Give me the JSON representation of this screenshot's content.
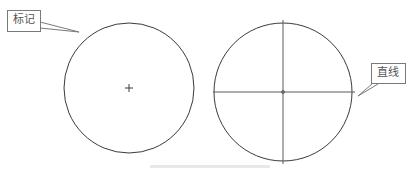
{
  "figure": {
    "left_circle": {
      "callout_label": "标记",
      "center_mark": "+"
    },
    "right_circle": {
      "callout_label": "直线"
    },
    "caption": ""
  },
  "colors": {
    "stroke": "#3a3a3a",
    "callout_border": "#7a7a7a",
    "callout_text": "#555555"
  }
}
